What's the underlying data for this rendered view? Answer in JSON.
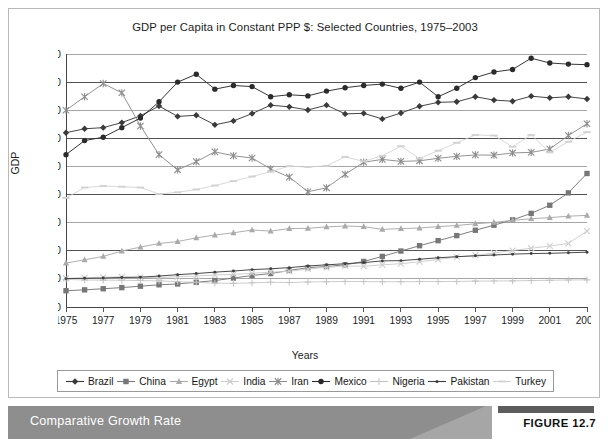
{
  "figure": {
    "caption": "Comparative Growth Rate",
    "figure_number": "FIGURE 12.7",
    "band_color": "#8a8a8a"
  },
  "chart_data": {
    "type": "line",
    "title": "GDP per Capita in Constant PPP $: Selected Countries, 1975–2003",
    "xlabel": "Years",
    "ylabel": "GDP",
    "grid": true,
    "legend_position": "bottom",
    "xlim": [
      1975,
      2003
    ],
    "ylim": [
      0,
      9000
    ],
    "ytick_labels": [
      "9,000",
      "8,000",
      "7,000",
      "6,000",
      "5,000",
      "4,000",
      "3,000",
      "2,000",
      "1,000",
      "0"
    ],
    "ytick_values": [
      9000,
      8000,
      7000,
      6000,
      5000,
      4000,
      3000,
      2000,
      1000,
      0
    ],
    "x": [
      1975,
      1976,
      1977,
      1978,
      1979,
      1980,
      1981,
      1982,
      1983,
      1984,
      1985,
      1986,
      1987,
      1988,
      1989,
      1990,
      1991,
      1992,
      1993,
      1994,
      1995,
      1996,
      1997,
      1998,
      1999,
      2000,
      2001,
      2002,
      2003
    ],
    "xtick_labels": [
      "1975",
      "1977",
      "1979",
      "1981",
      "1983",
      "1985",
      "1987",
      "1989",
      "1991",
      "1993",
      "1995",
      "1997",
      "1999",
      "2001",
      "2003"
    ],
    "series": [
      {
        "name": "Brazil",
        "marker": "diamond",
        "color": "#3a3a3a",
        "values": [
          6200,
          6340,
          6380,
          6560,
          6800,
          7150,
          6780,
          6820,
          6480,
          6620,
          6880,
          7180,
          7120,
          7010,
          7180,
          6870,
          6890,
          6690,
          6900,
          7140,
          7280,
          7300,
          7480,
          7360,
          7320,
          7500,
          7440,
          7480,
          7400
        ]
      },
      {
        "name": "China",
        "marker": "square",
        "color": "#777777",
        "values": [
          580,
          610,
          650,
          690,
          740,
          790,
          820,
          880,
          940,
          1030,
          1120,
          1190,
          1300,
          1400,
          1440,
          1500,
          1620,
          1800,
          1990,
          2180,
          2360,
          2540,
          2730,
          2910,
          3100,
          3330,
          3620,
          4060,
          4750
        ]
      },
      {
        "name": "Egypt",
        "marker": "triangle",
        "color": "#aaaaaa",
        "values": [
          1560,
          1680,
          1800,
          1990,
          2130,
          2260,
          2330,
          2460,
          2560,
          2640,
          2740,
          2700,
          2790,
          2800,
          2850,
          2880,
          2860,
          2760,
          2790,
          2810,
          2860,
          2900,
          2960,
          3010,
          3080,
          3140,
          3180,
          3230,
          3260
        ]
      },
      {
        "name": "India",
        "marker": "x",
        "color": "#cccccc",
        "values": [
          1020,
          1040,
          1060,
          1070,
          1060,
          1040,
          1080,
          1100,
          1140,
          1160,
          1200,
          1240,
          1270,
          1350,
          1410,
          1460,
          1450,
          1500,
          1540,
          1610,
          1690,
          1780,
          1840,
          1920,
          2010,
          2090,
          2170,
          2260,
          2700
        ]
      },
      {
        "name": "Iran",
        "marker": "asterisk",
        "color": "#8d8d8d",
        "values": [
          7000,
          7480,
          7950,
          7620,
          6440,
          5420,
          4880,
          5170,
          5520,
          5380,
          5300,
          4910,
          4620,
          4100,
          4240,
          4720,
          5150,
          5250,
          5180,
          5200,
          5290,
          5360,
          5410,
          5400,
          5480,
          5500,
          5620,
          6100,
          6520
        ]
      },
      {
        "name": "Mexico",
        "marker": "circle",
        "color": "#2b2b2b",
        "values": [
          5420,
          5920,
          6040,
          6380,
          6720,
          7300,
          8000,
          8280,
          7750,
          7880,
          7840,
          7480,
          7550,
          7510,
          7680,
          7800,
          7880,
          7930,
          7780,
          8000,
          7480,
          7780,
          8160,
          8360,
          8450,
          8850,
          8680,
          8640,
          8620
        ]
      },
      {
        "name": "Nigeria",
        "marker": "plus",
        "color": "#c4c4c4",
        "values": [
          980,
          960,
          955,
          950,
          940,
          930,
          900,
          880,
          850,
          840,
          860,
          880,
          870,
          890,
          900,
          910,
          905,
          900,
          900,
          905,
          905,
          910,
          920,
          925,
          930,
          940,
          950,
          960,
          965
        ]
      },
      {
        "name": "Pakistan",
        "marker": "dot",
        "color": "#404040",
        "values": [
          1010,
          1020,
          1030,
          1050,
          1060,
          1100,
          1150,
          1190,
          1240,
          1280,
          1330,
          1360,
          1400,
          1460,
          1500,
          1540,
          1580,
          1640,
          1650,
          1700,
          1750,
          1790,
          1820,
          1850,
          1880,
          1900,
          1910,
          1930,
          1950
        ]
      },
      {
        "name": "Turkey",
        "marker": "dash",
        "color": "#d2d2d2",
        "values": [
          3880,
          4250,
          4300,
          4280,
          4250,
          4020,
          4080,
          4180,
          4320,
          4480,
          4640,
          4820,
          5010,
          4980,
          5020,
          5340,
          5180,
          5380,
          5720,
          5280,
          5560,
          5840,
          6120,
          6100,
          5700,
          6120,
          5500,
          5880,
          6220
        ]
      }
    ]
  }
}
